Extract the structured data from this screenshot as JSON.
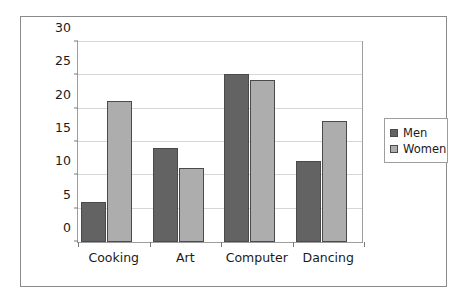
{
  "chart_data": {
    "type": "bar",
    "title": "",
    "xlabel": "",
    "ylabel": "Number of people",
    "categories": [
      "Cooking",
      "Art",
      "Computer",
      "Dancing"
    ],
    "series": [
      {
        "name": "Men",
        "values": [
          6,
          14,
          25,
          12
        ],
        "color": "#636363"
      },
      {
        "name": "Women",
        "values": [
          21,
          11,
          24,
          18
        ],
        "color": "#adadad"
      }
    ],
    "ylim": [
      0,
      30
    ],
    "ytick_step": 5,
    "yticks": [
      0,
      5,
      10,
      15,
      20,
      25,
      30
    ],
    "ytick_labels": [
      "0",
      "5",
      "10",
      "15",
      "20",
      "25",
      "30"
    ],
    "grid": "horizontal",
    "legend_position": "right-outside",
    "legend_entries": [
      "Men",
      "Women"
    ]
  },
  "colors": {
    "men_bar": "#636363",
    "women_bar": "#adadad",
    "bar_outline": "#4a4a4a",
    "gridline": "#d6d6d6",
    "axis": "#9e9e9e",
    "frame": "#8a8a8a",
    "text": "#1a1a1a",
    "background": "#ffffff"
  }
}
